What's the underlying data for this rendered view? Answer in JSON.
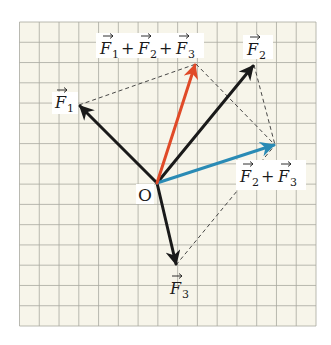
{
  "figure": {
    "grid": {
      "left": 19.5,
      "top": 22,
      "right": 316,
      "bottom": 326,
      "cols": 15,
      "rows": 15,
      "background": "#f7f5ea",
      "line_color": "#a8a8a0"
    },
    "origin": {
      "x": 157,
      "y": 183,
      "label": "O"
    },
    "vectors": [
      {
        "id": "F1",
        "tip": [
          79,
          105
        ],
        "color": "#1a1a1a"
      },
      {
        "id": "F2",
        "tip": [
          254,
          65
        ],
        "color": "#1a1a1a"
      },
      {
        "id": "F3",
        "tip": [
          176,
          265
        ],
        "color": "#1a1a1a"
      },
      {
        "id": "F2+F3",
        "tip": [
          275,
          145
        ],
        "color": "#2a8bb5"
      },
      {
        "id": "F1+F2+F3",
        "tip": [
          196,
          64
        ],
        "color": "#e04a28"
      }
    ],
    "dashed_lines": [
      [
        [
          79,
          105
        ],
        [
          196,
          64
        ]
      ],
      [
        [
          196,
          64
        ],
        [
          275,
          145
        ]
      ],
      [
        [
          254,
          65
        ],
        [
          275,
          145
        ]
      ],
      [
        [
          176,
          265
        ],
        [
          275,
          145
        ]
      ]
    ],
    "labels": {
      "F1": {
        "base": "F",
        "sub": "1"
      },
      "F2": {
        "base": "F",
        "sub": "2"
      },
      "F3": {
        "base": "F",
        "sub": "3"
      },
      "sum23": {
        "parts": [
          "F",
          "2",
          "+",
          "F",
          "3"
        ]
      },
      "sum123": {
        "parts": [
          "F",
          "1",
          "+",
          "F",
          "2",
          "+",
          "F",
          "3"
        ]
      },
      "origin": "O"
    }
  }
}
